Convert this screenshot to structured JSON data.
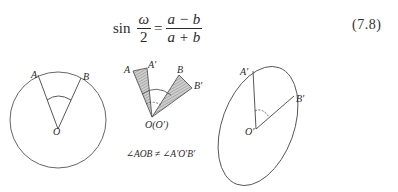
{
  "equation": {
    "function": "sin",
    "lhs_numerator": "ω",
    "lhs_denominator": "2",
    "equals": "=",
    "rhs_numerator": "a − b",
    "rhs_denominator": "a + b",
    "number": "(7.8)"
  },
  "figures": {
    "left_circle": {
      "label_a": "A",
      "label_b": "B",
      "label_center": "O"
    },
    "middle_sectors": {
      "label_a": "A",
      "label_a_prime": "A′",
      "label_b": "B",
      "label_b_prime": "B′",
      "label_center": "O(O′)",
      "caption": "∠AOB ≠ ∠A′O′B′"
    },
    "right_ellipse": {
      "label_a_prime": "A′",
      "label_b_prime": "B′",
      "label_center": "O′"
    }
  },
  "colors": {
    "ink": "#2a2a2a",
    "hatch_fill": "#bdbdbd",
    "background": "#ffffff"
  }
}
